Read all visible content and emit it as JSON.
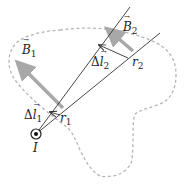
{
  "diagram": {
    "type": "physics-magnetic-field-current-element",
    "labels": {
      "B1": {
        "symbol": "B",
        "subscript": "1"
      },
      "B2": {
        "symbol": "B",
        "subscript": "2"
      },
      "dl1": {
        "prefix": "Δ",
        "symbol": "l",
        "subscript": "1"
      },
      "dl2": {
        "prefix": "Δ",
        "symbol": "l",
        "subscript": "2"
      },
      "r1": {
        "symbol": "r",
        "subscript": "1"
      },
      "r2": {
        "symbol": "r",
        "subscript": "2"
      },
      "I": {
        "symbol": "I"
      }
    },
    "colors": {
      "line": "#333333",
      "field_arrow": "#a8a8a8",
      "contour": "#b5b5b5",
      "text": "#222222"
    }
  }
}
